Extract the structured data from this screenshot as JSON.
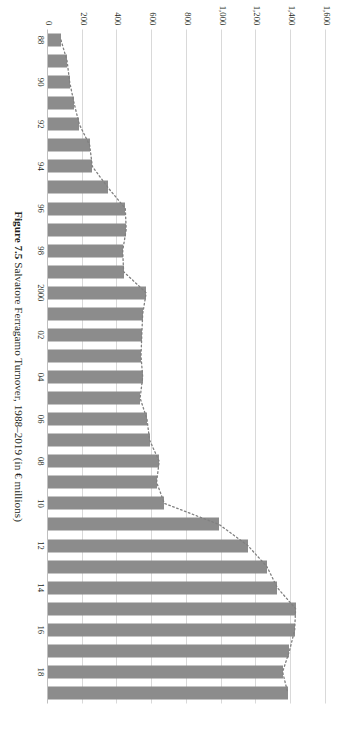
{
  "figure": {
    "number_label": "Figure 7.5",
    "caption_text": "Salvatore Ferragamo Turnover, 1988–2019 (in € millions)",
    "bar_color": "#8c8c8c",
    "gridline_color": "#d9d9d9",
    "trend_color": "#808080",
    "background": "#ffffff"
  },
  "chart_data": {
    "type": "bar",
    "orientation": "horizontal",
    "title": "Salvatore Ferragamo Turnover, 1988–2019 (in € millions)",
    "xlabel": "",
    "ylabel": "",
    "grid": true,
    "legend": "none",
    "value_axis": {
      "min": 0,
      "max": 1600,
      "tick_step": 200,
      "tick_labels": [
        "1,600",
        "1,400",
        "1,200",
        "1,000",
        "800",
        "600",
        "400",
        "200",
        "0"
      ],
      "tick_values": [
        1600,
        1400,
        1200,
        1000,
        800,
        600,
        400,
        200,
        0
      ],
      "unit": "€ millions"
    },
    "category_axis": {
      "labelled_ticks": [
        "88",
        "90",
        "92",
        "94",
        "96",
        "98",
        "2000",
        "02",
        "04",
        "06",
        "08",
        "10",
        "12",
        "14",
        "16",
        "18"
      ],
      "label_interval": 2
    },
    "categories": [
      "88",
      "89",
      "90",
      "91",
      "92",
      "93",
      "94",
      "95",
      "96",
      "97",
      "98",
      "99",
      "2000",
      "01",
      "02",
      "03",
      "04",
      "05",
      "06",
      "07",
      "08",
      "09",
      "10",
      "11",
      "12",
      "13",
      "14",
      "15",
      "16",
      "17",
      "18",
      "19"
    ],
    "values": [
      75,
      110,
      125,
      150,
      180,
      240,
      255,
      345,
      445,
      450,
      430,
      435,
      565,
      545,
      540,
      535,
      545,
      530,
      570,
      585,
      640,
      625,
      670,
      985,
      1150,
      1260,
      1320,
      1425,
      1420,
      1390,
      1350,
      1380
    ],
    "series": [
      {
        "name": "Turnover",
        "type": "bar",
        "values": [
          75,
          110,
          125,
          150,
          180,
          240,
          255,
          345,
          445,
          450,
          430,
          435,
          565,
          545,
          540,
          535,
          545,
          530,
          570,
          585,
          640,
          625,
          670,
          985,
          1150,
          1260,
          1320,
          1425,
          1420,
          1390,
          1350,
          1380
        ]
      },
      {
        "name": "Trend",
        "type": "line",
        "style": "dotted",
        "values": [
          75,
          110,
          125,
          150,
          180,
          240,
          255,
          345,
          445,
          450,
          430,
          435,
          565,
          545,
          540,
          535,
          545,
          530,
          570,
          585,
          640,
          625,
          670,
          985,
          1150,
          1260,
          1320,
          1425,
          1420,
          1390,
          1350,
          1380
        ]
      }
    ]
  }
}
